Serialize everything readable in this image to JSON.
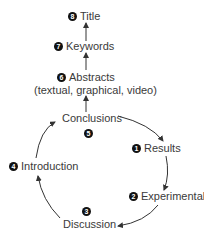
{
  "diagram": {
    "nodes": [
      {
        "id": "title",
        "number": "8",
        "label": "Title"
      },
      {
        "id": "keywords",
        "number": "7",
        "label": "Keywords"
      },
      {
        "id": "abstracts",
        "number": "6",
        "label": "Abstracts",
        "sublabel": "(textual, graphical, video)"
      },
      {
        "id": "conclusions",
        "number": "5",
        "label": "Conclusions"
      },
      {
        "id": "results",
        "number": "1",
        "label": "Results"
      },
      {
        "id": "experimental",
        "number": "2",
        "label": "Experimental"
      },
      {
        "id": "discussion",
        "number": "3",
        "label": "Discussion"
      },
      {
        "id": "introduction",
        "number": "4",
        "label": "Introduction"
      }
    ],
    "edges": [
      [
        "conclusions",
        "results"
      ],
      [
        "results",
        "experimental"
      ],
      [
        "experimental",
        "discussion"
      ],
      [
        "discussion",
        "introduction"
      ],
      [
        "introduction",
        "conclusions"
      ],
      [
        "conclusions",
        "abstracts"
      ],
      [
        "abstracts",
        "keywords"
      ],
      [
        "keywords",
        "title"
      ]
    ],
    "colors": {
      "text": "#3a3a3a",
      "badge": "#111111",
      "arrow": "#333333"
    }
  }
}
